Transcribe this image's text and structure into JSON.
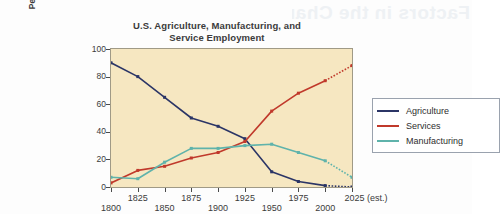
{
  "watermark": {
    "text": "Factors in the Change"
  },
  "chart_data": {
    "type": "line",
    "title": "U.S. Agriculture, Manufacturing, and Service Employment",
    "title_line1": "U.S. Agriculture, Manufacturing, and",
    "title_line2": "Service Employment",
    "xlabel": "",
    "ylabel": "Percent of workforce",
    "xlim": [
      1800,
      2025
    ],
    "ylim": [
      0,
      100
    ],
    "grid": false,
    "legend_position": "right",
    "plot_background": "#f6e7c1",
    "x": [
      1800,
      1825,
      1850,
      1875,
      1900,
      1925,
      1950,
      1975,
      2000,
      2025
    ],
    "categories": [
      "1800",
      "1825",
      "1850",
      "1875",
      "1900",
      "1925",
      "1950",
      "1975",
      "2000",
      "2025 (est.)"
    ],
    "xtick_labels": [
      "1800",
      "1825",
      "1850",
      "1875",
      "1900",
      "1925",
      "1950",
      "1975",
      "2000",
      "2025 (est.)"
    ],
    "ytick_labels": [
      "0",
      "20",
      "40",
      "60",
      "80",
      "100"
    ],
    "ytick_values": [
      0,
      20,
      40,
      60,
      80,
      100
    ],
    "estimate_note": "(est.)",
    "estimated_from_x": 2000,
    "series": [
      {
        "name": "Agriculture",
        "color": "#2b3566",
        "values": [
          90,
          80,
          65,
          50,
          44,
          35,
          11,
          4,
          1,
          0
        ]
      },
      {
        "name": "Services",
        "color": "#c0392b",
        "values": [
          3,
          12,
          15,
          21,
          25,
          33,
          55,
          68,
          77,
          88
        ]
      },
      {
        "name": "Manufacturing",
        "color": "#5fb3ab",
        "values": [
          7,
          6,
          18,
          28,
          28,
          30,
          31,
          25,
          19,
          7
        ]
      }
    ]
  },
  "legend": {
    "items": [
      {
        "label": "Agriculture",
        "color": "#2b3566"
      },
      {
        "label": "Services",
        "color": "#c0392b"
      },
      {
        "label": "Manufacturing",
        "color": "#5fb3ab"
      }
    ]
  }
}
